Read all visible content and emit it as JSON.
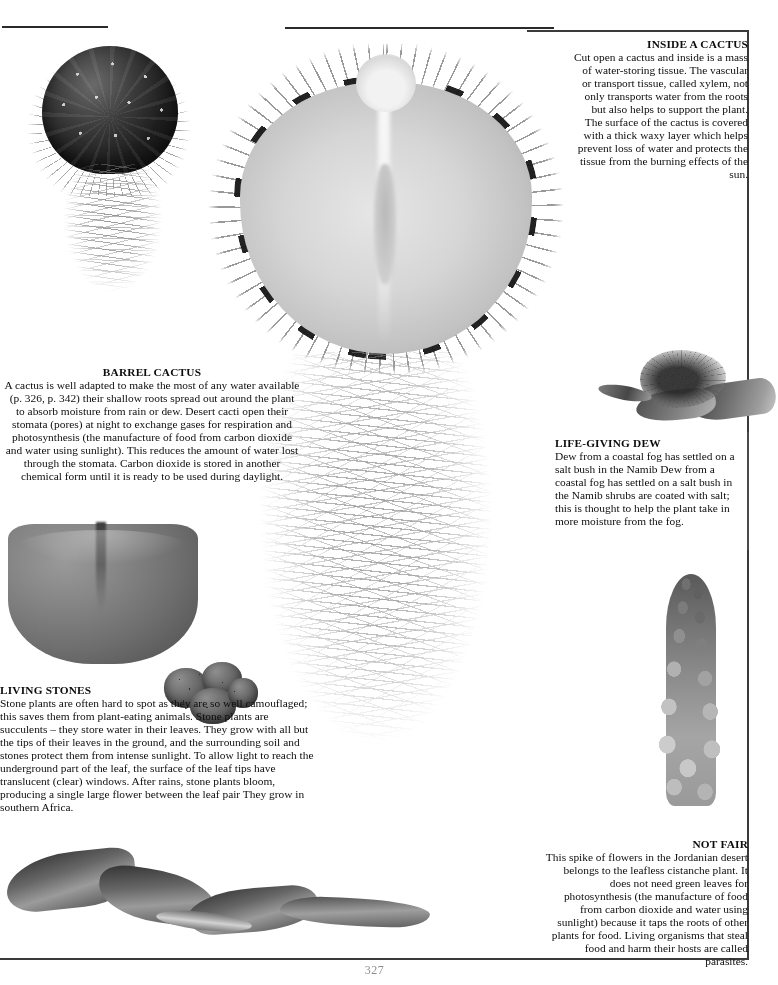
{
  "page": {
    "page_number": "327",
    "background_color": "#ffffff",
    "ink_color": "#0d0d0d",
    "rule_color": "#3a3a3a"
  },
  "blocks": {
    "inside_cactus": {
      "heading": "INSIDE A CACTUS",
      "body": "Cut open a cactus and inside is a mass of water-storing tissue. The vascular or transport tissue, called xylem, not only transports water from the roots but also helps to support the plant. The surface of the cactus is covered with a thick waxy layer which helps prevent loss of water and protects the tissue from the burning effects of the sun."
    },
    "barrel_cactus": {
      "heading": "BARREL CACTUS",
      "body": "A cactus is well adapted to make the most of any water available (p. 326, p. 342) their shallow roots spread out around the plant to absorb moisture from rain or dew. Desert cacti open their stomata (pores) at night to exchange gases for respiration and photosynthesis (the manufacture of food from carbon dioxide and water using sunlight). This reduces the amount of water lost through the stomata. Carbon dioxide is stored in another chemical form until it is ready to be used during daylight."
    },
    "life_giving_dew": {
      "heading": "LIFE-GIVING DEW",
      "body": "Dew from a coastal fog has settled on a salt bush in the Namib Dew from a coastal fog has settled on a salt bush in the Namib shrubs are coated with salt; this is thought to help the plant take in more moisture from the fog."
    },
    "living_stones": {
      "heading": "LIVING STONES",
      "body": "Stone plants are often hard to spot as they are so well camouflaged; this saves them from plant-eating animals. Stone plants are succulents – they store water in their leaves. They grow with all but the tips of their leaves in the ground, and the surrounding soil and stones protect them from intense sunlight. To allow light to reach the underground part of the leaf, the surface of the leaf tips have translucent (clear) windows. After rains, stone plants bloom, producing a single large flower between the leaf pair  They grow in southern Africa."
    },
    "not_fair": {
      "heading": "NOT FAIR",
      "body": "This spike of flowers in the Jordanian desert belongs to the leafless cistanche plant. It does not need green leaves for photosynthesis (the manufacture of food from carbon dioxide and water using sunlight) because it taps the roots of other plants for food. Living organisms that steal food and harm their hosts are called parasites."
    }
  },
  "figures": [
    {
      "name": "small-barrel-cactus-with-roots",
      "caption_block": "barrel_cactus"
    },
    {
      "name": "cactus-cross-section",
      "caption_block": "inside_cactus"
    },
    {
      "name": "cactus-root-mass",
      "caption_block": "barrel_cactus"
    },
    {
      "name": "living-stone-leaf-pair",
      "caption_block": "living_stones"
    },
    {
      "name": "living-stone-clump",
      "caption_block": "living_stones"
    },
    {
      "name": "hand-holding-dew-salt-bush",
      "caption_block": "life_giving_dew"
    },
    {
      "name": "cistanche-flower-spike",
      "caption_block": "not_fair"
    },
    {
      "name": "withered-twisted-leaves",
      "caption_block": "living_stones"
    }
  ]
}
